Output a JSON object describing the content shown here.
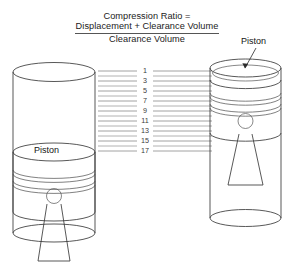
{
  "figure": {
    "title_line1": "Compression Ratio =",
    "numerator": "Displacement + Clearance Volume",
    "denominator": "Clearance Volume"
  },
  "labels": {
    "piston_left": "Piston",
    "piston_right": "Piston"
  },
  "scale": {
    "numbers": [
      "1",
      "3",
      "5",
      "7",
      "9",
      "11",
      "13",
      "15",
      "17"
    ],
    "minor_line_count": 8,
    "total_lines": 17
  },
  "colors": {
    "outline": "#3a3a3a",
    "scale_line": "#9a9a9a",
    "text": "#1a1a1a",
    "background": "#ffffff"
  },
  "parts": {
    "left_cylinder_name": "cylinder-piston-at-bottom",
    "right_cylinder_name": "cylinder-piston-at-top"
  }
}
